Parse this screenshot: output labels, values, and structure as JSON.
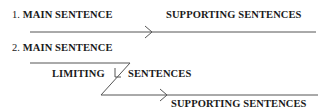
{
  "diagram": {
    "pattern1": {
      "number": "1.",
      "main_label": "MAIN SENTENCE",
      "supporting_label": "SUPPORTING SENTENCES"
    },
    "pattern2": {
      "number": "2.",
      "main_label": "MAIN SENTENCE",
      "limiting_label": "LIMITING",
      "sentences_label": "SENTENCES",
      "supporting_label": "SUPPORTING SENTENCES"
    },
    "line_color": "#555555"
  }
}
